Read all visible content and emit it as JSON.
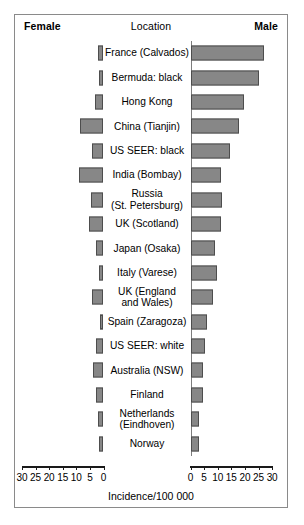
{
  "header": {
    "left_label": "Female",
    "center_label": "Location",
    "right_label": "Male"
  },
  "axis": {
    "title": "Incidence/100 000",
    "ticks": [
      "0",
      "5",
      "10",
      "15",
      "20",
      "25",
      "30"
    ],
    "min": 0,
    "max": 30
  },
  "chart_data": {
    "type": "bar",
    "title": "",
    "subtitle": "",
    "xlabel": "Incidence/100 000",
    "ylabel": "Location",
    "orientation": "horizontal-bidirectional",
    "xlim": [
      0,
      30
    ],
    "grid": false,
    "legend_position": "top",
    "categories": [
      "France (Calvados)",
      "Bermuda: black",
      "Hong Kong",
      "China (Tianjin)",
      "US SEER: black",
      "India (Bombay)",
      "Russia\n(St. Petersburg)",
      "UK (Scotland)",
      "Japan (Osaka)",
      "Italy (Varese)",
      "UK (England\nand Wales)",
      "Spain (Zaragoza)",
      "US SEER: white",
      "Australia (NSW)",
      "Finland",
      "Netherlands\n(Eindhoven)",
      "Norway"
    ],
    "series": [
      {
        "name": "Female",
        "side": "left",
        "values": [
          2.0,
          1.5,
          3.0,
          8.5,
          4.0,
          9.0,
          4.5,
          5.0,
          2.5,
          1.5,
          4.0,
          1.0,
          2.5,
          3.5,
          2.5,
          2.0,
          1.5
        ]
      },
      {
        "name": "Male",
        "side": "right",
        "values": [
          27.0,
          25.0,
          19.5,
          17.5,
          14.5,
          11.0,
          11.5,
          11.0,
          9.0,
          9.5,
          8.0,
          6.0,
          5.0,
          4.5,
          4.5,
          3.0,
          3.0
        ]
      }
    ]
  },
  "colors": {
    "bar_fill": "#878787",
    "bar_stroke": "#4d4d4d",
    "baseline": "#7d7d7d",
    "axis": "#1a1a1a",
    "frame": "#8a8a8a"
  }
}
